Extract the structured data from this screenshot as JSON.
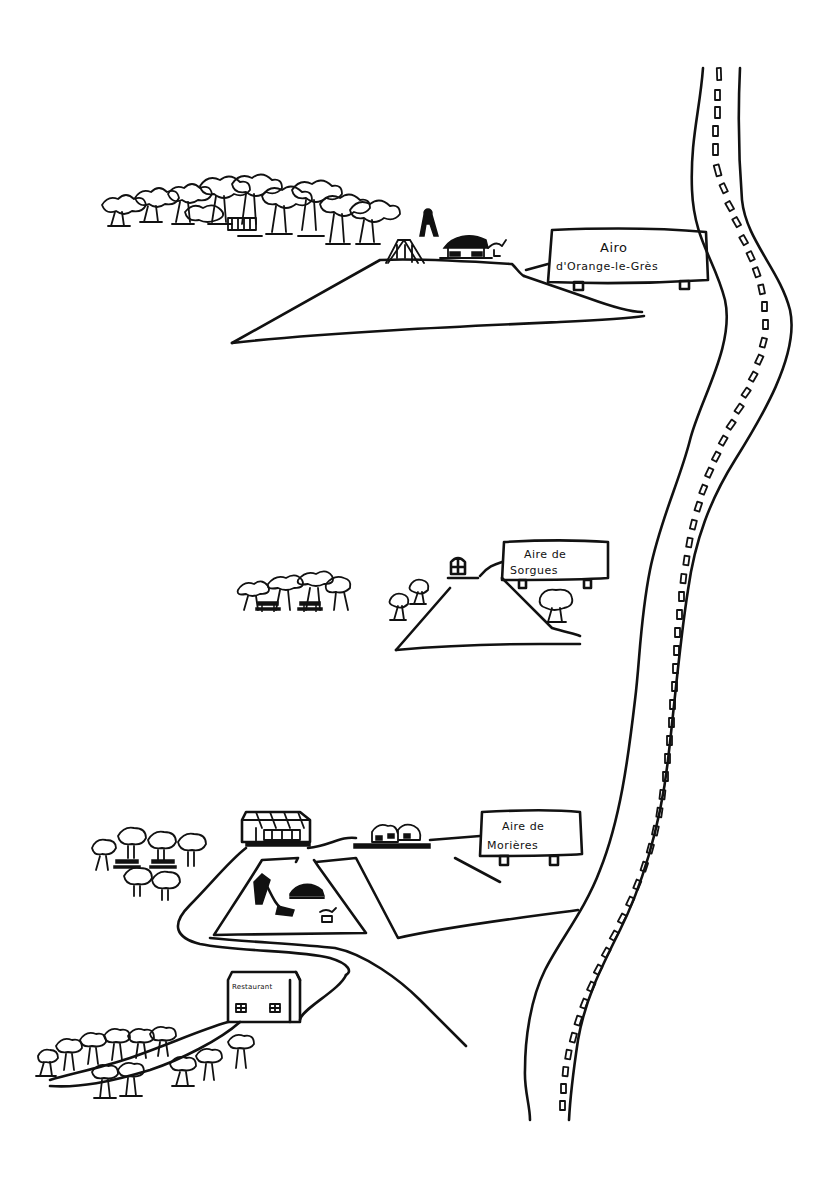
{
  "illustration": {
    "type": "hand-drawn map of highway rest areas",
    "ink_color": "#111111",
    "background_color": "#ffffff"
  },
  "highway": {
    "label": "highway",
    "lane_marker_style": "dashed-rectangles"
  },
  "rest_areas": [
    {
      "id": "orange-le-gres",
      "sign": {
        "line1": "Airo",
        "line2": "d'Orange-le-Grès"
      },
      "features": [
        "forest",
        "swings",
        "climbing-frame",
        "picnic-shelter",
        "spring-rider"
      ]
    },
    {
      "id": "sorgues",
      "sign": {
        "line1": "Aire de",
        "line2": "Sorgues"
      },
      "features": [
        "trees",
        "picnic-tables",
        "toilet-block"
      ]
    },
    {
      "id": "morieres",
      "sign": {
        "line1": "Aire de",
        "line2": "Morières"
      },
      "features": [
        "shop-building",
        "fuel-station",
        "picnic-tables",
        "slide",
        "sandpit",
        "spring-rider",
        "restaurant",
        "forest"
      ]
    }
  ],
  "restaurant": {
    "label": "Restaurant"
  }
}
